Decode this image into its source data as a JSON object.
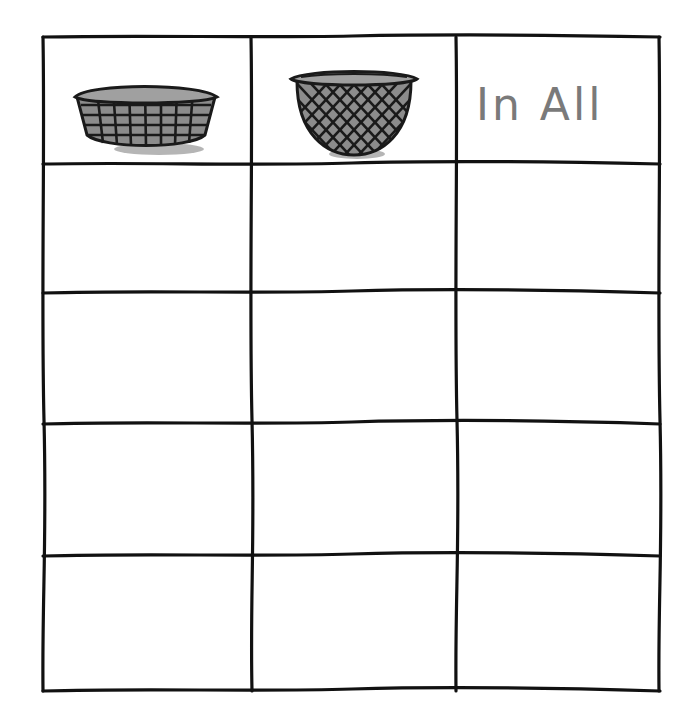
{
  "worksheet": {
    "table": {
      "columns": [
        {
          "type": "icon",
          "icon": "oval-basket-icon",
          "label": ""
        },
        {
          "type": "icon",
          "icon": "round-basket-icon",
          "label": ""
        },
        {
          "type": "text",
          "label": "In All"
        }
      ],
      "rows": [
        [
          "",
          "",
          ""
        ],
        [
          "",
          "",
          ""
        ],
        [
          "",
          "",
          ""
        ],
        [
          "",
          "",
          ""
        ]
      ]
    },
    "colors": {
      "line": "#111111",
      "text": "#7a7a7a",
      "basket_fill": "#8c8c8c",
      "basket_line": "#1a1a1a",
      "shadow": "#b5b5b5"
    }
  }
}
